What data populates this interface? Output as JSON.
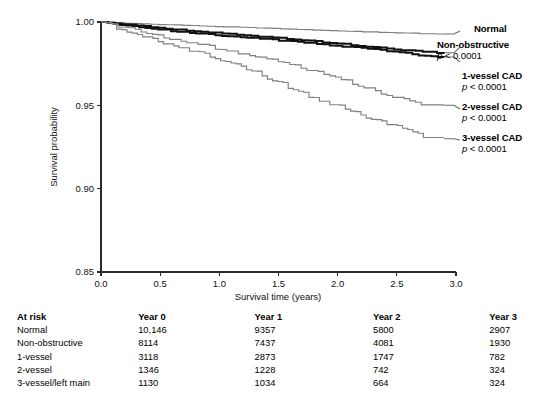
{
  "chart_data": {
    "type": "line",
    "title": "",
    "xlabel": "Survival time (years)",
    "ylabel": "Survival probability",
    "xlim": [
      0.0,
      3.0
    ],
    "ylim": [
      0.85,
      1.0
    ],
    "xticks": [
      "0.0",
      "0.5",
      "1.0",
      "1.5",
      "2.0",
      "2.5",
      "3.0"
    ],
    "yticks": [
      "0.85",
      "0.90",
      "0.95",
      "1.00"
    ],
    "grid": false,
    "legend_position": "right-of-axes",
    "series": [
      {
        "name": "Normal",
        "p_value": "p < 0.0001",
        "color": "#808080",
        "weight": "thin",
        "x": [
          0.0,
          0.15,
          0.3,
          0.5,
          0.7,
          0.9,
          1.1,
          1.3,
          1.5,
          1.7,
          1.9,
          2.1,
          2.3,
          2.5,
          2.7,
          2.9
        ],
        "y": [
          1.0,
          0.9995,
          0.9991,
          0.9985,
          0.998,
          0.9975,
          0.997,
          0.9965,
          0.996,
          0.9955,
          0.995,
          0.9945,
          0.994,
          0.9935,
          0.993,
          0.9928
        ]
      },
      {
        "name": "Non-obstructive",
        "p_value": "p < 0.0001",
        "color": "#111111",
        "weight": "bold",
        "x": [
          0.0,
          0.15,
          0.3,
          0.5,
          0.7,
          0.9,
          1.1,
          1.3,
          1.5,
          1.7,
          1.9,
          2.1,
          2.3,
          2.5,
          2.7,
          2.9
        ],
        "y": [
          1.0,
          0.999,
          0.998,
          0.9965,
          0.9952,
          0.994,
          0.9928,
          0.9916,
          0.9903,
          0.989,
          0.9878,
          0.9864,
          0.985,
          0.9836,
          0.9822,
          0.9815
        ]
      },
      {
        "name": "1-vessel CAD",
        "p_value": "p < 0.0001",
        "color": "#111111",
        "weight": "bold",
        "x": [
          0.0,
          0.15,
          0.3,
          0.5,
          0.7,
          0.9,
          1.1,
          1.3,
          1.5,
          1.7,
          1.9,
          2.1,
          2.3,
          2.5,
          2.7,
          2.9
        ],
        "y": [
          1.0,
          0.9986,
          0.9972,
          0.9955,
          0.994,
          0.9927,
          0.9915,
          0.9903,
          0.989,
          0.9877,
          0.9864,
          0.985,
          0.9835,
          0.982,
          0.98,
          0.979
        ]
      },
      {
        "name": "2-vessel CAD",
        "p_value": "p < 0.0001",
        "color": "#808080",
        "weight": "thin",
        "x": [
          0.0,
          0.15,
          0.3,
          0.5,
          0.7,
          0.9,
          1.1,
          1.3,
          1.5,
          1.7,
          1.9,
          2.1,
          2.3,
          2.5,
          2.7,
          2.9
        ],
        "y": [
          1.0,
          0.9975,
          0.995,
          0.9915,
          0.9885,
          0.9855,
          0.9825,
          0.9795,
          0.976,
          0.9725,
          0.9685,
          0.964,
          0.959,
          0.9545,
          0.951,
          0.95
        ]
      },
      {
        "name": "3-vessel CAD",
        "p_value": "p < 0.0001",
        "color": "#808080",
        "weight": "thin",
        "x": [
          0.0,
          0.15,
          0.3,
          0.5,
          0.7,
          0.9,
          1.1,
          1.3,
          1.5,
          1.7,
          1.9,
          2.1,
          2.3,
          2.5,
          2.7,
          2.9
        ],
        "y": [
          1.0,
          0.9965,
          0.993,
          0.9885,
          0.9845,
          0.98,
          0.9755,
          0.97,
          0.964,
          0.9575,
          0.952,
          0.947,
          0.942,
          0.9375,
          0.932,
          0.93
        ]
      }
    ]
  },
  "legend": [
    {
      "name": "Normal",
      "p_value": "p < 0.0001",
      "show_p": false
    },
    {
      "name": "Non-obstructive",
      "p_value": "p < 0.0001",
      "show_p": true
    },
    {
      "name": "1-vessel CAD",
      "p_value": "p < 0.0001",
      "show_p": true
    },
    {
      "name": "2-vessel CAD",
      "p_value": "p < 0.0001",
      "show_p": true
    },
    {
      "name": "3-vessel CAD",
      "p_value": "p < 0.0001",
      "show_p": true
    }
  ],
  "risk_table": {
    "caption": "At risk",
    "columns": [
      "At risk",
      "Year 0",
      "Year 1",
      "Year 2",
      "Year 3"
    ],
    "rows": [
      {
        "label": "Normal",
        "values": [
          "10,146",
          "9357",
          "5800",
          "2907"
        ]
      },
      {
        "label": "Non-obstructive",
        "values": [
          "8114",
          "7437",
          "4081",
          "1930"
        ]
      },
      {
        "label": "1-vessel",
        "values": [
          "3118",
          "2873",
          "1747",
          "782"
        ]
      },
      {
        "label": "2-vessel",
        "values": [
          "1346",
          "1228",
          "742",
          "324"
        ]
      },
      {
        "label": "3-vessel/left main",
        "values": [
          "1130",
          "1034",
          "664",
          "324"
        ]
      }
    ]
  },
  "colors": {
    "axis": "#2a2a2a",
    "gray_series": "#808080",
    "black_series": "#111111",
    "background": "#ffffff"
  }
}
